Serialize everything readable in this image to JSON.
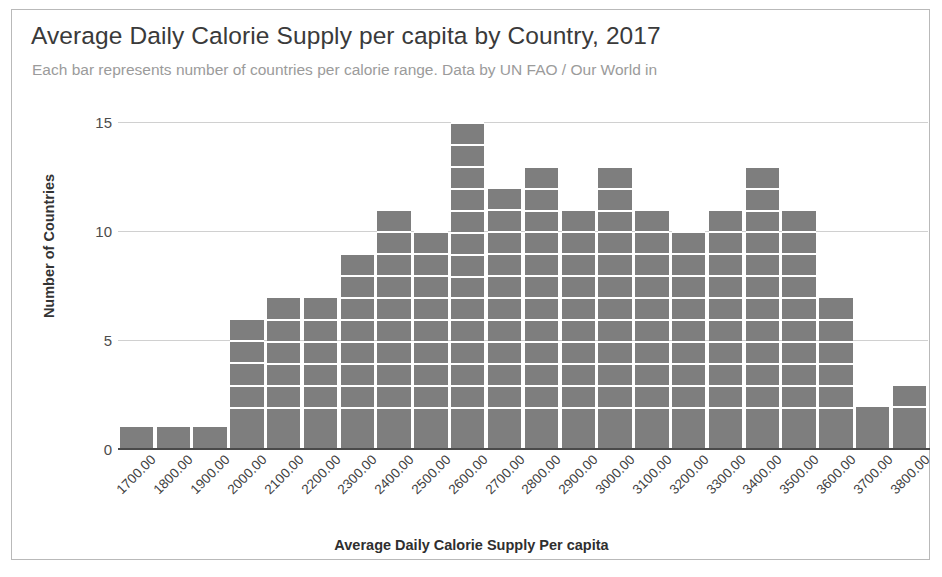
{
  "chart_data": {
    "type": "bar",
    "title": "Average Daily Calorie Supply per capita by Country, 2017",
    "subtitle": "Each bar represents number of countries per calorie range. Data by UN FAO / Our World in",
    "xlabel": "Average Daily Calorie Supply Per capita",
    "ylabel": "Number of Countries",
    "categories": [
      "1700.00",
      "1800.00",
      "1900.00",
      "2000.00",
      "2100.00",
      "2200.00",
      "2300.00",
      "2400.00",
      "2500.00",
      "2600.00",
      "2700.00",
      "2800.00",
      "2900.00",
      "3000.00",
      "3100.00",
      "3200.00",
      "3300.00",
      "3400.00",
      "3500.00",
      "3600.00",
      "3700.00",
      "3800.00"
    ],
    "values": [
      1,
      1,
      1,
      6,
      7,
      7,
      9,
      11,
      10,
      15,
      12,
      13,
      11,
      13,
      11,
      10,
      11,
      13,
      11,
      7,
      2,
      3
    ],
    "ylim": [
      0,
      15
    ],
    "yticks": [
      "0",
      "5",
      "10",
      "15"
    ],
    "ytick_values": [
      0,
      5,
      10,
      15
    ],
    "grid": true,
    "legend": "none",
    "bar_color": "#7e7e7e",
    "gridline_color": "#d0d0d0",
    "axis_color": "#4a4a4a",
    "title_color": "#3a3a3a",
    "subtitle_color": "#9b9b9b",
    "segment_separator_color": "#ffffff",
    "border_color": "#b9b9b9"
  }
}
